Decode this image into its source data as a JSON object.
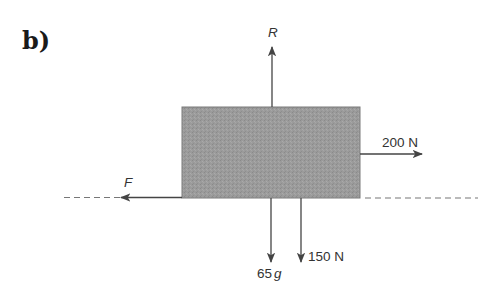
{
  "diagram": {
    "part_label": "b)",
    "block": {
      "fill": "#9b9b9b",
      "edge": "#7a7a7a"
    },
    "ground_line": {
      "style": "dashed",
      "color": "#777777"
    },
    "forces": [
      {
        "id": "R",
        "label": "R",
        "direction": "up",
        "italic": true
      },
      {
        "id": "applied",
        "label": "200 N",
        "direction": "right",
        "italic": false
      },
      {
        "id": "F",
        "label": "F",
        "direction": "left",
        "italic": true
      },
      {
        "id": "weight",
        "label_num": "65",
        "label_sym": "g",
        "direction": "down",
        "italic": false
      },
      {
        "id": "push_down",
        "label": "150 N",
        "direction": "down",
        "italic": false
      }
    ],
    "arrow_color": "#444444"
  }
}
